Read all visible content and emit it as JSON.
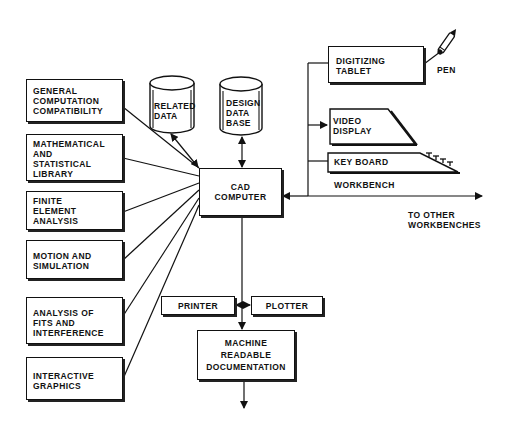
{
  "diagram": {
    "central_node": {
      "id": "cad",
      "lines": [
        "CAD",
        "COMPUTER"
      ]
    },
    "software_modules": [
      {
        "id": "gcc",
        "lines": [
          "GENERAL",
          "COMPUTATION",
          "COMPATIBILITY"
        ]
      },
      {
        "id": "msl",
        "lines": [
          "MATHEMATICAL",
          "AND",
          "STATISTICAL",
          "LIBRARY"
        ]
      },
      {
        "id": "fea",
        "lines": [
          "FINITE",
          "ELEMENT",
          "ANALYSIS"
        ]
      },
      {
        "id": "mas",
        "lines": [
          "MOTION AND",
          "SIMULATION"
        ]
      },
      {
        "id": "afi",
        "lines": [
          "ANALYSIS OF",
          "FITS AND",
          "INTERFERENCE"
        ]
      },
      {
        "id": "ig",
        "lines": [
          "INTERACTIVE",
          "GRAPHICS"
        ]
      }
    ],
    "databases": [
      {
        "id": "related",
        "lines": [
          "RELATED",
          "DATA"
        ]
      },
      {
        "id": "design",
        "lines": [
          "DESIGN",
          "DATA",
          "BASE"
        ]
      }
    ],
    "workbench": {
      "label": "WORKBENCH",
      "devices": [
        {
          "id": "tablet",
          "lines": [
            "DIGITIZING",
            "TABLET"
          ]
        },
        {
          "id": "video",
          "lines": [
            "VIDEO",
            "DISPLAY"
          ]
        },
        {
          "id": "keyboard",
          "lines": [
            "KEY BOARD"
          ]
        }
      ],
      "pen_label": "PEN",
      "other_label": [
        "TO OTHER",
        "WORKBENCHES"
      ]
    },
    "outputs": {
      "printer": "PRINTER",
      "plotter": "PLOTTER",
      "documentation": [
        "MACHINE",
        "READABLE",
        "DOCUMENTATION"
      ]
    },
    "edges": [
      {
        "from": "gcc",
        "to": "cad",
        "type": "line"
      },
      {
        "from": "msl",
        "to": "cad",
        "type": "line"
      },
      {
        "from": "fea",
        "to": "cad",
        "type": "line"
      },
      {
        "from": "mas",
        "to": "cad",
        "type": "line"
      },
      {
        "from": "afi",
        "to": "cad",
        "type": "line"
      },
      {
        "from": "ig",
        "to": "cad",
        "type": "line"
      },
      {
        "from": "related",
        "to": "cad",
        "type": "bidirectional"
      },
      {
        "from": "design",
        "to": "cad",
        "type": "bidirectional"
      },
      {
        "from": "workbench",
        "to": "cad",
        "type": "arrow"
      },
      {
        "from": "workbench",
        "to": "video",
        "type": "arrow"
      },
      {
        "from": "workbench",
        "to": "other_workbenches",
        "type": "arrow"
      },
      {
        "from": "cad",
        "to": "documentation",
        "type": "arrow"
      },
      {
        "from": "bus",
        "to": "printer",
        "type": "arrow"
      },
      {
        "from": "bus",
        "to": "plotter",
        "type": "arrow"
      },
      {
        "from": "documentation",
        "to": "out",
        "type": "arrow"
      }
    ]
  }
}
